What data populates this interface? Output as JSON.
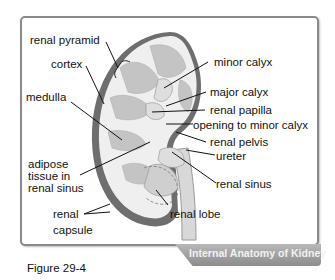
{
  "figure": {
    "caption": "Figure 29-4",
    "title_banner": "Internal Anatomy of Kidney"
  },
  "labels": {
    "renal_pyramid": "renal pyramid",
    "cortex": "cortex",
    "medulla": "medulla",
    "adipose_line1": "adipose",
    "adipose_line2": "tissue in",
    "adipose_line3": "renal sinus",
    "renal_capsule_line1": "renal",
    "renal_capsule_line2": "capsule",
    "minor_calyx": "minor calyx",
    "major_calyx": "major calyx",
    "renal_papilla": "renal papilla",
    "opening_to_minor_calyx": "opening to minor calyx",
    "renal_pelvis": "renal pelvis",
    "ureter": "ureter",
    "renal_sinus": "renal sinus",
    "renal_lobe": "renal lobe"
  },
  "colors": {
    "capsule": "#6e6e6e",
    "cortex": "#ececec",
    "pyramid": "#bdbdbd",
    "frame_border": "#8a8a8a",
    "banner": "#9e9e9e"
  }
}
